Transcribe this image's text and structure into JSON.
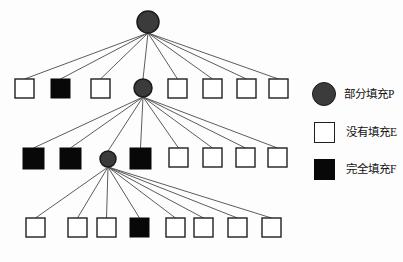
{
  "figure": {
    "type": "tree-diagram",
    "background_color": "#ffffff",
    "width": 403,
    "height": 262
  },
  "colors": {
    "partial_fill": "#3b3b3b",
    "partial_fill_stroke": "#1a1a1a",
    "empty_fill": "#ffffff",
    "empty_stroke": "#1f1f1f",
    "full_fill": "#080808",
    "edge": "#4a4a4a",
    "text": "#111111"
  },
  "legend": {
    "items": [
      {
        "marker": "circle",
        "icon_name": "partial-fill-circle-icon",
        "label": "部分填充P"
      },
      {
        "marker": "square-empty",
        "icon_name": "empty-fill-square-icon",
        "label": "没有填充E"
      },
      {
        "marker": "square-filled",
        "icon_name": "full-fill-square-icon",
        "label": "完全填充F"
      }
    ]
  },
  "tree": {
    "levels": [
      {
        "level": 0,
        "y": 22,
        "nodes": [
          {
            "id": "root",
            "type": "partial",
            "label": "P",
            "cx": 148,
            "cy": 22,
            "r": 11
          }
        ]
      },
      {
        "level": 1,
        "y": 88,
        "nodes": [
          {
            "id": "n1-1",
            "type": "empty",
            "label": "E",
            "x": 15,
            "y": 79,
            "size": 19
          },
          {
            "id": "n1-2",
            "type": "full",
            "label": "F",
            "x": 51,
            "y": 79,
            "size": 19
          },
          {
            "id": "n1-3",
            "type": "empty",
            "label": "E",
            "x": 91,
            "y": 79,
            "size": 19
          },
          {
            "id": "n1-4",
            "type": "partial",
            "label": "P",
            "cx": 143,
            "cy": 88,
            "r": 9
          },
          {
            "id": "n1-5",
            "type": "empty",
            "label": "E",
            "x": 168,
            "y": 79,
            "size": 19
          },
          {
            "id": "n1-6",
            "type": "empty",
            "label": "E",
            "x": 203,
            "y": 79,
            "size": 19
          },
          {
            "id": "n1-7",
            "type": "empty",
            "label": "E",
            "x": 237,
            "y": 79,
            "size": 19
          },
          {
            "id": "n1-8",
            "type": "empty",
            "label": "E",
            "x": 269,
            "y": 79,
            "size": 19
          }
        ]
      },
      {
        "level": 2,
        "y": 159,
        "nodes": [
          {
            "id": "n2-1",
            "type": "full",
            "label": "F",
            "x": 23,
            "y": 148,
            "size": 21
          },
          {
            "id": "n2-2",
            "type": "full",
            "label": "F",
            "x": 60,
            "y": 148,
            "size": 21
          },
          {
            "id": "n2-3",
            "type": "partial",
            "label": "P",
            "cx": 108,
            "cy": 159,
            "r": 8
          },
          {
            "id": "n2-4",
            "type": "full",
            "label": "F",
            "x": 130,
            "y": 148,
            "size": 21
          },
          {
            "id": "n2-5",
            "type": "empty",
            "label": "E",
            "x": 169,
            "y": 148,
            "size": 19
          },
          {
            "id": "n2-6",
            "type": "empty",
            "label": "E",
            "x": 203,
            "y": 148,
            "size": 19
          },
          {
            "id": "n2-7",
            "type": "empty",
            "label": "E",
            "x": 236,
            "y": 148,
            "size": 19
          },
          {
            "id": "n2-8",
            "type": "empty",
            "label": "E",
            "x": 268,
            "y": 148,
            "size": 19
          }
        ]
      },
      {
        "level": 3,
        "y": 228,
        "nodes": [
          {
            "id": "n3-1",
            "type": "empty",
            "label": "E",
            "x": 26,
            "y": 218,
            "size": 19
          },
          {
            "id": "n3-2",
            "type": "empty",
            "label": "E",
            "x": 68,
            "y": 218,
            "size": 19
          },
          {
            "id": "n3-3",
            "type": "empty",
            "label": "E",
            "x": 97,
            "y": 218,
            "size": 19
          },
          {
            "id": "n3-4",
            "type": "full",
            "label": "F",
            "x": 130,
            "y": 218,
            "size": 19
          },
          {
            "id": "n3-5",
            "type": "empty",
            "label": "E",
            "x": 166,
            "y": 218,
            "size": 19
          },
          {
            "id": "n3-6",
            "type": "empty",
            "label": "E",
            "x": 194,
            "y": 218,
            "size": 19
          },
          {
            "id": "n3-7",
            "type": "empty",
            "label": "E",
            "x": 228,
            "y": 218,
            "size": 19
          },
          {
            "id": "n3-8",
            "type": "empty",
            "label": "E",
            "x": 262,
            "y": 218,
            "size": 19
          }
        ]
      }
    ],
    "edges": [
      {
        "from": "root",
        "to": "n1-1"
      },
      {
        "from": "root",
        "to": "n1-2"
      },
      {
        "from": "root",
        "to": "n1-3"
      },
      {
        "from": "root",
        "to": "n1-4"
      },
      {
        "from": "root",
        "to": "n1-5"
      },
      {
        "from": "root",
        "to": "n1-6"
      },
      {
        "from": "root",
        "to": "n1-7"
      },
      {
        "from": "root",
        "to": "n1-8"
      },
      {
        "from": "n1-4",
        "to": "n2-1"
      },
      {
        "from": "n1-4",
        "to": "n2-2"
      },
      {
        "from": "n1-4",
        "to": "n2-3"
      },
      {
        "from": "n1-4",
        "to": "n2-4"
      },
      {
        "from": "n1-4",
        "to": "n2-5"
      },
      {
        "from": "n1-4",
        "to": "n2-6"
      },
      {
        "from": "n1-4",
        "to": "n2-7"
      },
      {
        "from": "n1-4",
        "to": "n2-8"
      },
      {
        "from": "n2-3",
        "to": "n3-1"
      },
      {
        "from": "n2-3",
        "to": "n3-2"
      },
      {
        "from": "n2-3",
        "to": "n3-3"
      },
      {
        "from": "n2-3",
        "to": "n3-4"
      },
      {
        "from": "n2-3",
        "to": "n3-5"
      },
      {
        "from": "n2-3",
        "to": "n3-6"
      },
      {
        "from": "n2-3",
        "to": "n3-7"
      },
      {
        "from": "n2-3",
        "to": "n3-8"
      }
    ]
  }
}
